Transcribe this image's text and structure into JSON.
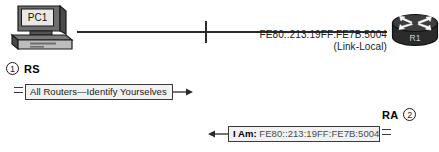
{
  "diagram": {
    "nodes": {
      "pc": {
        "label": "PC1",
        "icon": "desktop-computer-icon"
      },
      "router": {
        "label": "R1",
        "icon": "router-icon"
      }
    },
    "link": {
      "address": "FE80::213:19FF:FE7B:5004",
      "address_type": "(Link-Local)"
    },
    "steps": [
      {
        "number": "1",
        "label": "RS",
        "message": "All Routers—Identify Yourselves",
        "direction": "right"
      },
      {
        "number": "2",
        "label": "RA",
        "message_prefix": "I Am:",
        "message_address": "FE80::213:19FF:FE7B:5004",
        "direction": "left"
      }
    ]
  },
  "colors": {
    "line": "#2b2b2b",
    "box_fill": "#f2f2f2",
    "box_border": "#3a3a3a",
    "text": "#1a1a1a"
  }
}
